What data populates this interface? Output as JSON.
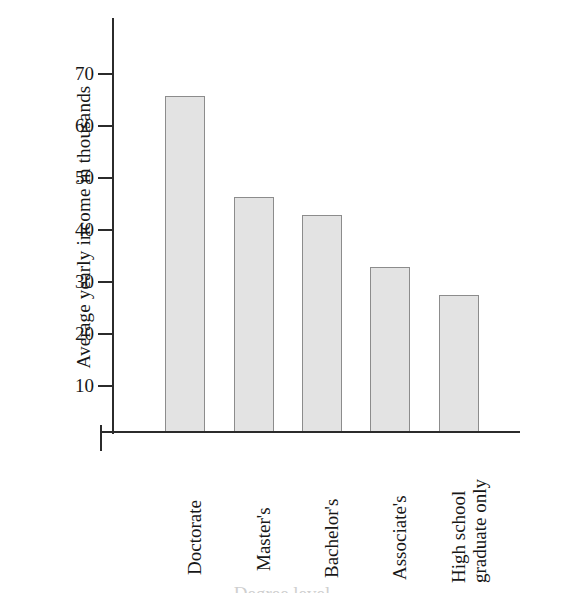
{
  "chart_data": {
    "type": "bar",
    "title": "",
    "xlabel": "Degree level",
    "ylabel": "Average yearly income in thousands",
    "categories": [
      "Doctorate",
      "Master's",
      "Bachelor's",
      "Associate's",
      "High school graduate only"
    ],
    "values": [
      65.5,
      45.8,
      42.3,
      32.0,
      26.5
    ],
    "ylim": [
      0,
      78
    ],
    "yticks": [
      10,
      20,
      30,
      40,
      50,
      60,
      70
    ],
    "ytick_labels": [
      "10",
      "20",
      "30",
      "40",
      "50",
      "60",
      "70"
    ],
    "grid": false,
    "legend": null,
    "bar_fill": "#e3e3e3",
    "bar_border": "#8c8c8c",
    "axis_color": "#2b2b2b"
  },
  "axis": {
    "y_title": "Average yearly income in thousands",
    "x_title": "Degree level"
  },
  "categories": [
    {
      "label": "Doctorate",
      "line1": "Doctorate",
      "line2": ""
    },
    {
      "label": "Master's",
      "line1": "Master's",
      "line2": ""
    },
    {
      "label": "Bachelor's",
      "line1": "Bachelor's",
      "line2": ""
    },
    {
      "label": "Associate's",
      "line1": "Associate's",
      "line2": ""
    },
    {
      "label": "High school graduate only",
      "line1": "High school",
      "line2": "graduate only"
    }
  ],
  "yticks": [
    {
      "label": "70"
    },
    {
      "label": "60"
    },
    {
      "label": "50"
    },
    {
      "label": "40"
    },
    {
      "label": "30"
    },
    {
      "label": "20"
    },
    {
      "label": "10"
    }
  ]
}
